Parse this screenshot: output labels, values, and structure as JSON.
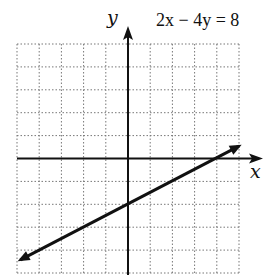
{
  "chart_data": {
    "type": "line",
    "xlabel": "x",
    "ylabel": "y",
    "xlim": [
      -5,
      5
    ],
    "ylim": [
      -5,
      5
    ],
    "grid": true,
    "series": [
      {
        "name": "2x - 4y = 8",
        "x": [
          -5,
          0,
          4,
          5
        ],
        "y": [
          -4.5,
          -2,
          0,
          0.5
        ]
      }
    ],
    "annotations": [
      "2x - 4y = 8"
    ],
    "intercepts": {
      "x_intercept": 4,
      "y_intercept": -2
    }
  },
  "labels": {
    "equation": "2x − 4y = 8",
    "x_axis": "x",
    "y_axis": "y"
  }
}
